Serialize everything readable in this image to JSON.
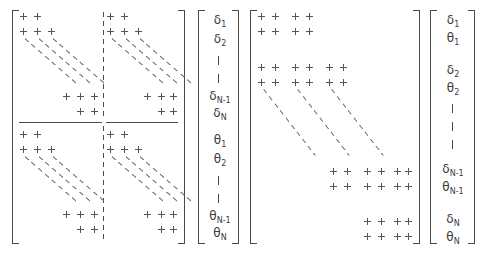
{
  "figure": {
    "kind": "matrix-equation-sparsity-diagram",
    "symbols": {
      "nonzero_mark": "+",
      "continuation_mark": "|",
      "diagonal_fill": "dashed-diagonal-band"
    }
  },
  "left": {
    "name": "block-partitioned-system",
    "matrix": {
      "label": "block-2x2-matrix",
      "quadrants": [
        {
          "name": "top-left-block"
        },
        {
          "name": "top-right-block"
        },
        {
          "name": "bottom-left-block"
        },
        {
          "name": "bottom-right-block"
        }
      ]
    },
    "vector": {
      "label": "grouped-unknown-vector",
      "entries": [
        {
          "base": "δ",
          "sub": "1"
        },
        {
          "base": "δ",
          "sub": "2"
        },
        {
          "base": "|",
          "sub": ""
        },
        {
          "base": "|",
          "sub": ""
        },
        {
          "base": "δ",
          "sub": "N-1"
        },
        {
          "base": "δ",
          "sub": "N"
        },
        {
          "base": "θ",
          "sub": "1"
        },
        {
          "base": "θ",
          "sub": "2"
        },
        {
          "base": "|",
          "sub": ""
        },
        {
          "base": "|",
          "sub": ""
        },
        {
          "base": "θ",
          "sub": "N-1"
        },
        {
          "base": "θ",
          "sub": "N"
        }
      ]
    }
  },
  "right": {
    "name": "interleaved-banded-system",
    "matrix": {
      "label": "block-tridiagonal-matrix"
    },
    "vector": {
      "label": "interleaved-unknown-vector",
      "entries": [
        {
          "base": "δ",
          "sub": "1"
        },
        {
          "base": "θ",
          "sub": "1"
        },
        {
          "base": "δ",
          "sub": "2"
        },
        {
          "base": "θ",
          "sub": "2"
        },
        {
          "base": "|",
          "sub": ""
        },
        {
          "base": "|",
          "sub": ""
        },
        {
          "base": "|",
          "sub": ""
        },
        {
          "base": "δ",
          "sub": "N-1"
        },
        {
          "base": "θ",
          "sub": "N-1"
        },
        {
          "base": "δ",
          "sub": "N"
        },
        {
          "base": "θ",
          "sub": "N"
        }
      ]
    }
  },
  "colors": {
    "ink": "#3a3a3a",
    "rule": "#4a4a4a",
    "mark": "#555555",
    "background": "#ffffff"
  }
}
